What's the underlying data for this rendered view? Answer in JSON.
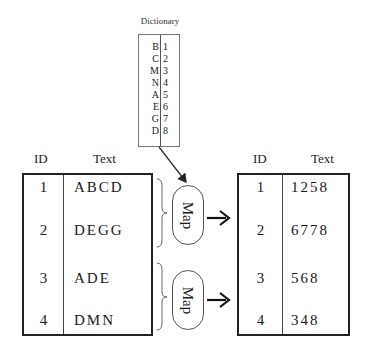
{
  "dictionary": {
    "title": "Dictionary",
    "entries": [
      {
        "key": "B",
        "value": "1"
      },
      {
        "key": "C",
        "value": "2"
      },
      {
        "key": "M",
        "value": "3"
      },
      {
        "key": "N",
        "value": "4"
      },
      {
        "key": "A",
        "value": "5"
      },
      {
        "key": "E",
        "value": "6"
      },
      {
        "key": "G",
        "value": "7"
      },
      {
        "key": "D",
        "value": "8"
      }
    ]
  },
  "input_table": {
    "headers": {
      "id": "ID",
      "text": "Text"
    },
    "rows": [
      {
        "id": "1",
        "text": "ABCD"
      },
      {
        "id": "2",
        "text": "DEGG"
      },
      {
        "id": "3",
        "text": "ADE"
      },
      {
        "id": "4",
        "text": "DMN"
      }
    ]
  },
  "map_steps": [
    {
      "label": "Map"
    },
    {
      "label": "Map"
    }
  ],
  "output_table": {
    "headers": {
      "id": "ID",
      "text": "Text"
    },
    "rows": [
      {
        "id": "1",
        "text": "1258"
      },
      {
        "id": "2",
        "text": "6778"
      },
      {
        "id": "3",
        "text": "568"
      },
      {
        "id": "4",
        "text": "348"
      }
    ]
  }
}
